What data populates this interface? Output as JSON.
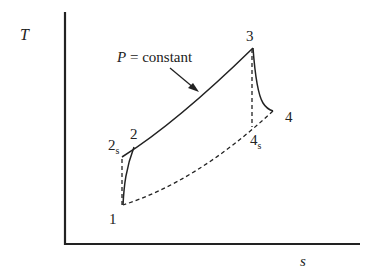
{
  "diagram": {
    "type": "T-s diagram (Brayton cycle)",
    "axes": {
      "y_label": "T",
      "x_label": "s"
    },
    "annotation": {
      "var": "P",
      "text": " = constant"
    },
    "points": [
      {
        "id": "1",
        "label": "1",
        "sub": ""
      },
      {
        "id": "2s",
        "label": "2",
        "sub": "s"
      },
      {
        "id": "2",
        "label": "2",
        "sub": ""
      },
      {
        "id": "3",
        "label": "3",
        "sub": ""
      },
      {
        "id": "4s",
        "label": "4",
        "sub": "s"
      },
      {
        "id": "4",
        "label": "4",
        "sub": ""
      }
    ],
    "colors": {
      "line": "#222222",
      "background": "#ffffff"
    }
  }
}
